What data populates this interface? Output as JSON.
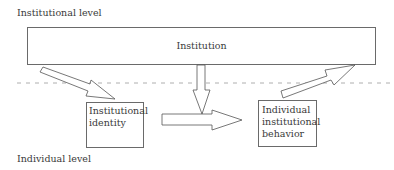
{
  "diagram": {
    "levels": {
      "top": "Institutional level",
      "bottom": "Individual level"
    },
    "nodes": {
      "institution": "Institution",
      "identity": [
        "Institutional",
        "identity"
      ],
      "behavior": [
        "Individual",
        "institutional",
        "behavior"
      ]
    },
    "edges": [
      {
        "from": "institution",
        "to": "identity",
        "style": "hollow-arrow"
      },
      {
        "from": "institution",
        "to": "identity-behavior-link",
        "style": "hollow-arrow-down"
      },
      {
        "from": "identity",
        "to": "behavior",
        "style": "hollow-arrow-right"
      },
      {
        "from": "behavior",
        "to": "institution",
        "style": "hollow-arrow-up-right"
      }
    ],
    "divider": "dashed"
  }
}
